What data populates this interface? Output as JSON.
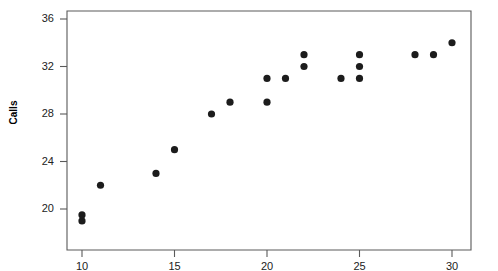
{
  "chart_data": {
    "type": "scatter",
    "title": "",
    "xlabel": "",
    "ylabel": "Calls",
    "xlim": [
      8.6,
      30.6
    ],
    "ylim": [
      17.6,
      36.0
    ],
    "xticks": [
      10,
      15,
      20,
      25,
      30
    ],
    "yticks": [
      20,
      24,
      28,
      32,
      36
    ],
    "xtick_labels": [
      "10",
      "15",
      "20",
      "25",
      "30"
    ],
    "ytick_labels": [
      "20",
      "24",
      "28",
      "32",
      "36"
    ],
    "grid": false,
    "legend": null,
    "marker": "filled-circle",
    "marker_color": "#1c1c1c",
    "points": [
      {
        "x": 10,
        "y": 19.0
      },
      {
        "x": 10,
        "y": 19.5
      },
      {
        "x": 11,
        "y": 22.0
      },
      {
        "x": 14,
        "y": 23.0
      },
      {
        "x": 15,
        "y": 25.0
      },
      {
        "x": 17,
        "y": 28.0
      },
      {
        "x": 18,
        "y": 29.0
      },
      {
        "x": 20,
        "y": 29.0
      },
      {
        "x": 20,
        "y": 31.0
      },
      {
        "x": 21,
        "y": 31.0
      },
      {
        "x": 22,
        "y": 32.0
      },
      {
        "x": 22,
        "y": 33.0
      },
      {
        "x": 24,
        "y": 31.0
      },
      {
        "x": 25,
        "y": 31.0
      },
      {
        "x": 25,
        "y": 32.0
      },
      {
        "x": 25,
        "y": 33.0
      },
      {
        "x": 28,
        "y": 33.0
      },
      {
        "x": 29,
        "y": 33.0
      },
      {
        "x": 30,
        "y": 34.0
      }
    ]
  },
  "axes": {
    "y_axis_title": "Calls"
  }
}
